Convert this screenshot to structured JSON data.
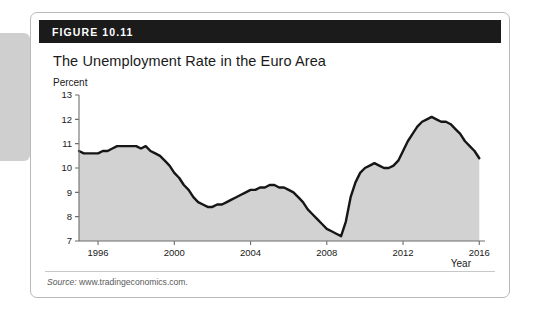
{
  "figure": {
    "label": "FIGURE 10.11",
    "title": "The Unemployment Rate in the Euro Area",
    "source_prefix": "Source:",
    "source_text": "www.tradingeconomics.com.",
    "header_bg": "#1b1b1b",
    "card_border": "#b9b9b9",
    "tab_color": "#cfcfcf"
  },
  "chart_data": {
    "type": "area",
    "title": "The Unemployment Rate in the Euro Area",
    "xlabel": "Year",
    "ylabel": "Percent",
    "xlim": [
      1995.0,
      2016.3
    ],
    "ylim": [
      7,
      13
    ],
    "xticks": [
      1996,
      2000,
      2004,
      2008,
      2012,
      2016
    ],
    "xticklabels": [
      "1996",
      "2000",
      "2004",
      "2008",
      "2012",
      "2016"
    ],
    "yticks": [
      7,
      8,
      9,
      10,
      11,
      12,
      13
    ],
    "yticklabels": [
      "7",
      "8",
      "9",
      "10",
      "11",
      "12",
      "13"
    ],
    "grid": false,
    "legend": null,
    "line_color": "#161616",
    "fill_color": "#d2d2d2",
    "axis_color": "#6e6e6e",
    "series": [
      {
        "name": "Euro area unemployment rate",
        "units": "percent",
        "x": [
          1995.0,
          1995.25,
          1995.5,
          1995.75,
          1996.0,
          1996.25,
          1996.5,
          1996.75,
          1997.0,
          1997.25,
          1997.5,
          1997.75,
          1998.0,
          1998.25,
          1998.5,
          1998.75,
          1999.0,
          1999.25,
          1999.5,
          1999.75,
          2000.0,
          2000.25,
          2000.5,
          2000.75,
          2001.0,
          2001.25,
          2001.5,
          2001.75,
          2002.0,
          2002.25,
          2002.5,
          2002.75,
          2003.0,
          2003.25,
          2003.5,
          2003.75,
          2004.0,
          2004.25,
          2004.5,
          2004.75,
          2005.0,
          2005.25,
          2005.5,
          2005.75,
          2006.0,
          2006.25,
          2006.5,
          2006.75,
          2007.0,
          2007.25,
          2007.5,
          2007.75,
          2008.0,
          2008.25,
          2008.5,
          2008.75,
          2009.0,
          2009.25,
          2009.5,
          2009.75,
          2010.0,
          2010.25,
          2010.5,
          2010.75,
          2011.0,
          2011.25,
          2011.5,
          2011.75,
          2012.0,
          2012.25,
          2012.5,
          2012.75,
          2013.0,
          2013.25,
          2013.5,
          2013.75,
          2014.0,
          2014.25,
          2014.5,
          2014.75,
          2015.0,
          2015.25,
          2015.5,
          2015.75,
          2016.0
        ],
        "y": [
          10.7,
          10.6,
          10.6,
          10.6,
          10.6,
          10.7,
          10.7,
          10.8,
          10.9,
          10.9,
          10.9,
          10.9,
          10.9,
          10.8,
          10.9,
          10.7,
          10.6,
          10.5,
          10.3,
          10.1,
          9.8,
          9.6,
          9.3,
          9.1,
          8.8,
          8.6,
          8.5,
          8.4,
          8.4,
          8.5,
          8.5,
          8.6,
          8.7,
          8.8,
          8.9,
          9.0,
          9.1,
          9.1,
          9.2,
          9.2,
          9.3,
          9.3,
          9.2,
          9.2,
          9.1,
          9.0,
          8.8,
          8.6,
          8.3,
          8.1,
          7.9,
          7.7,
          7.5,
          7.4,
          7.3,
          7.2,
          7.8,
          8.8,
          9.4,
          9.8,
          10.0,
          10.1,
          10.2,
          10.1,
          10.0,
          10.0,
          10.1,
          10.3,
          10.7,
          11.1,
          11.4,
          11.7,
          11.9,
          12.0,
          12.1,
          12.0,
          11.9,
          11.9,
          11.8,
          11.6,
          11.4,
          11.1,
          10.9,
          10.7,
          10.4
        ]
      }
    ],
    "annotations": {
      "start_value": 10.7,
      "first_peak": {
        "year": 1997.5,
        "value": 10.9
      },
      "first_trough": {
        "year": 2001.75,
        "value": 8.4
      },
      "mid_peak": {
        "year": 2005.0,
        "value": 9.3
      },
      "minimum": {
        "year": 2008.75,
        "value": 7.2
      },
      "maximum": {
        "year": 2013.5,
        "value": 12.1
      },
      "end_value": 10.4
    }
  }
}
